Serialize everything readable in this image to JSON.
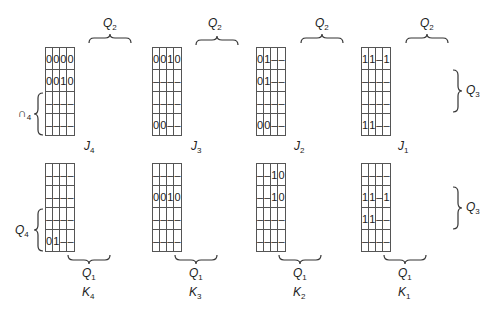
{
  "maps": [
    {
      "id": "J4",
      "name": "J",
      "sub": "4",
      "cells": [
        [
          "0",
          "0",
          "0",
          "0"
        ],
        [
          "0",
          "0",
          "1",
          "0"
        ],
        [
          "–",
          "–",
          "–",
          "–"
        ],
        [
          "–",
          "–",
          "–",
          "–"
        ]
      ]
    },
    {
      "id": "J3",
      "name": "J",
      "sub": "3",
      "cells": [
        [
          "0",
          "0",
          "1",
          "0"
        ],
        [
          "–",
          "–",
          "–",
          "–"
        ],
        [
          "–",
          "–",
          "–",
          "–"
        ],
        [
          "0",
          "0",
          "–",
          "–"
        ]
      ]
    },
    {
      "id": "J2",
      "name": "J",
      "sub": "2",
      "cells": [
        [
          "0",
          "1",
          "–",
          "–"
        ],
        [
          "0",
          "1",
          "–",
          "–"
        ],
        [
          "–",
          "–",
          "–",
          "–"
        ],
        [
          "0",
          "0",
          "–",
          "–"
        ]
      ]
    },
    {
      "id": "J1",
      "name": "J",
      "sub": "1",
      "cells": [
        [
          "1",
          "1",
          "–",
          "1"
        ],
        [
          "–",
          "–",
          "–",
          "–"
        ],
        [
          "–",
          "–",
          "–",
          "–"
        ],
        [
          "1",
          "1",
          "–",
          "–"
        ]
      ]
    },
    {
      "id": "K4",
      "name": "K",
      "sub": "4",
      "cells": [
        [
          "–",
          "–",
          "–",
          "–"
        ],
        [
          "–",
          "–",
          "–",
          "–"
        ],
        [
          "–",
          "–",
          "–",
          "–"
        ],
        [
          "0",
          "1",
          "–",
          "–"
        ]
      ]
    },
    {
      "id": "K3",
      "name": "K",
      "sub": "3",
      "cells": [
        [
          "–",
          "–",
          "–",
          "–"
        ],
        [
          "0",
          "0",
          "1",
          "0"
        ],
        [
          "–",
          "–",
          "–",
          "–"
        ],
        [
          "–",
          "–",
          "–",
          "–"
        ]
      ]
    },
    {
      "id": "K2",
      "name": "K",
      "sub": "2",
      "cells": [
        [
          "–",
          "–",
          "1",
          "0"
        ],
        [
          "–",
          "–",
          "1",
          "0"
        ],
        [
          "–",
          "–",
          "–",
          "–"
        ],
        [
          "–",
          "–",
          "–",
          "–"
        ]
      ]
    },
    {
      "id": "K1",
      "name": "K",
      "sub": "1",
      "cells": [
        [
          "–",
          "–",
          "–",
          "–"
        ],
        [
          "1",
          "1",
          "–",
          "1"
        ],
        [
          "1",
          "1",
          "–",
          "–"
        ],
        [
          "–",
          "–",
          "–",
          "–"
        ]
      ]
    }
  ],
  "variables": {
    "q2": {
      "name": "Q",
      "sub": "2"
    },
    "q3": {
      "name": "Q",
      "sub": "3"
    },
    "q4": {
      "name": "Q",
      "sub": "4"
    },
    "q4_top": {
      "name": "∩",
      "sub": "4"
    },
    "q1": {
      "name": "Q",
      "sub": "1"
    }
  }
}
